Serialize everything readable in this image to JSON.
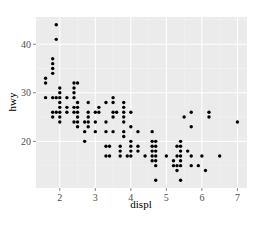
{
  "chart_data": {
    "type": "scatter",
    "title": "",
    "xlabel": "displ",
    "ylabel": "hwy",
    "xlim": [
      1.33,
      7.27
    ],
    "ylim": [
      10.4,
      45.6
    ],
    "xticks": [
      2,
      3,
      4,
      5,
      6,
      7
    ],
    "yticks": [
      20,
      30,
      40
    ],
    "grid": true,
    "legend": "none",
    "colors": {
      "panel": "#ebebeb",
      "grid_major": "#ffffff",
      "grid_minor": "#f5f5f5",
      "point": "#000000",
      "tick_text": "#4d4d4d"
    },
    "points": [
      [
        1.6,
        33
      ],
      [
        1.6,
        32
      ],
      [
        1.6,
        29
      ],
      [
        1.8,
        29
      ],
      [
        1.8,
        26
      ],
      [
        1.8,
        25
      ],
      [
        1.8,
        34
      ],
      [
        1.8,
        36
      ],
      [
        1.8,
        35
      ],
      [
        1.8,
        37
      ],
      [
        1.9,
        44
      ],
      [
        1.9,
        41
      ],
      [
        1.9,
        29
      ],
      [
        1.9,
        26
      ],
      [
        2.0,
        31
      ],
      [
        2.0,
        30
      ],
      [
        2.0,
        29
      ],
      [
        2.0,
        28
      ],
      [
        2.0,
        27
      ],
      [
        2.0,
        26
      ],
      [
        2.0,
        25
      ],
      [
        2.0,
        24
      ],
      [
        2.2,
        29
      ],
      [
        2.2,
        27
      ],
      [
        2.2,
        26
      ],
      [
        2.4,
        31
      ],
      [
        2.4,
        30
      ],
      [
        2.4,
        29
      ],
      [
        2.4,
        27
      ],
      [
        2.4,
        26
      ],
      [
        2.4,
        24
      ],
      [
        2.4,
        32
      ],
      [
        2.5,
        32
      ],
      [
        2.5,
        28
      ],
      [
        2.5,
        27
      ],
      [
        2.5,
        26
      ],
      [
        2.5,
        25
      ],
      [
        2.5,
        24
      ],
      [
        2.5,
        23
      ],
      [
        2.7,
        24
      ],
      [
        2.7,
        22
      ],
      [
        2.7,
        20
      ],
      [
        2.8,
        28
      ],
      [
        2.8,
        26
      ],
      [
        2.8,
        25
      ],
      [
        2.8,
        24
      ],
      [
        2.8,
        23
      ],
      [
        3.0,
        26
      ],
      [
        3.0,
        24
      ],
      [
        3.0,
        22
      ],
      [
        3.1,
        27
      ],
      [
        3.1,
        26
      ],
      [
        3.3,
        28
      ],
      [
        3.3,
        24
      ],
      [
        3.3,
        22
      ],
      [
        3.3,
        19
      ],
      [
        3.3,
        17
      ],
      [
        3.4,
        17
      ],
      [
        3.4,
        19
      ],
      [
        3.5,
        29
      ],
      [
        3.5,
        28
      ],
      [
        3.5,
        26
      ],
      [
        3.5,
        25
      ],
      [
        3.5,
        22
      ],
      [
        3.6,
        26
      ],
      [
        3.7,
        19
      ],
      [
        3.7,
        18
      ],
      [
        3.7,
        17
      ],
      [
        3.8,
        28
      ],
      [
        3.8,
        27
      ],
      [
        3.8,
        26
      ],
      [
        3.8,
        25
      ],
      [
        3.8,
        24
      ],
      [
        3.8,
        22
      ],
      [
        3.8,
        21
      ],
      [
        3.9,
        17
      ],
      [
        4.0,
        26
      ],
      [
        4.0,
        23
      ],
      [
        4.0,
        20
      ],
      [
        4.0,
        19
      ],
      [
        4.0,
        18
      ],
      [
        4.0,
        17
      ],
      [
        4.2,
        19
      ],
      [
        4.2,
        22
      ],
      [
        4.2,
        18
      ],
      [
        4.4,
        17
      ],
      [
        4.6,
        22
      ],
      [
        4.6,
        20
      ],
      [
        4.6,
        19
      ],
      [
        4.6,
        18
      ],
      [
        4.6,
        17
      ],
      [
        4.6,
        16
      ],
      [
        4.7,
        20
      ],
      [
        4.7,
        19
      ],
      [
        4.7,
        18
      ],
      [
        4.7,
        17
      ],
      [
        4.7,
        16
      ],
      [
        4.7,
        15
      ],
      [
        4.7,
        12
      ],
      [
        5.0,
        17
      ],
      [
        5.2,
        16
      ],
      [
        5.2,
        15
      ],
      [
        5.3,
        19
      ],
      [
        5.3,
        17
      ],
      [
        5.3,
        15
      ],
      [
        5.3,
        14
      ],
      [
        5.4,
        20
      ],
      [
        5.4,
        19
      ],
      [
        5.4,
        18
      ],
      [
        5.4,
        17
      ],
      [
        5.4,
        16
      ],
      [
        5.4,
        15
      ],
      [
        5.4,
        12
      ],
      [
        5.5,
        25
      ],
      [
        5.6,
        18
      ],
      [
        5.7,
        26
      ],
      [
        5.7,
        23
      ],
      [
        5.7,
        17
      ],
      [
        5.7,
        15
      ],
      [
        5.9,
        15
      ],
      [
        6.0,
        17
      ],
      [
        6.1,
        14
      ],
      [
        6.2,
        26
      ],
      [
        6.2,
        25
      ],
      [
        6.5,
        17
      ],
      [
        7.0,
        24
      ]
    ]
  }
}
